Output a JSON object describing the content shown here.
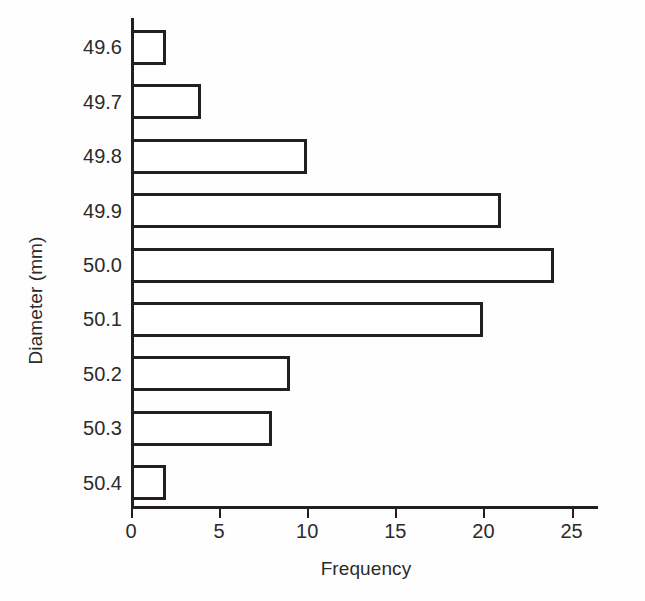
{
  "chart_data": {
    "type": "bar",
    "orientation": "horizontal",
    "title": "",
    "xlabel": "Frequency",
    "ylabel": "Diameter (mm)",
    "categories": [
      "49.6",
      "49.7",
      "49.8",
      "49.9",
      "50.0",
      "50.1",
      "50.2",
      "50.3",
      "50.4"
    ],
    "values": [
      2,
      4,
      10,
      21,
      24,
      20,
      9,
      8,
      2
    ],
    "xlim": [
      0,
      26.5
    ],
    "x_ticks": [
      0,
      5,
      10,
      15,
      20,
      25
    ],
    "x_tick_labels": [
      "0",
      "5",
      "10",
      "15",
      "20",
      "25"
    ],
    "grid": false,
    "legend": false,
    "bar_fill_color": "#ffffff",
    "bar_edge_color": "#231f20",
    "background_color": "#fefefe",
    "axis_color": "#231f20"
  }
}
